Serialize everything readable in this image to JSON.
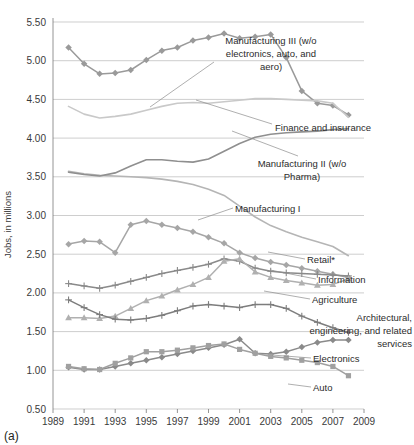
{
  "figure": {
    "caption": "(a)",
    "ylabel": "Jobs, in millions"
  },
  "chart_data": {
    "type": "line",
    "title": "",
    "xlabel": "",
    "ylabel": "Jobs, in millions",
    "xlim": [
      1989,
      2009
    ],
    "ylim": [
      0.5,
      5.5
    ],
    "yticks": [
      "0.50",
      "1.00",
      "1.50",
      "2.00",
      "2.50",
      "3.00",
      "3.50",
      "4.00",
      "4.50",
      "5.00",
      "5.50"
    ],
    "ytick_values": [
      0.5,
      1.0,
      1.5,
      2.0,
      2.5,
      3.0,
      3.5,
      4.0,
      4.5,
      5.0,
      5.5
    ],
    "xticks": [
      "1989",
      "1991",
      "1993",
      "1995",
      "1997",
      "1999",
      "2001",
      "2003",
      "2005",
      "2007",
      "2009"
    ],
    "xtick_values": [
      1989,
      1991,
      1993,
      1995,
      1997,
      1999,
      2001,
      2003,
      2005,
      2007,
      2009
    ],
    "grid": true,
    "legend": "inline-labels-right",
    "x": [
      1990,
      1991,
      1992,
      1993,
      1994,
      1995,
      1996,
      1997,
      1998,
      1999,
      2000,
      2001,
      2002,
      2003,
      2004,
      2005,
      2006,
      2007,
      2008
    ],
    "series": [
      {
        "name": "Manufacturing III (w/o electronics, auto, and aero)",
        "label": "Manufacturing III (w/o electronics, auto, and aero)",
        "color": "#9a9a9a",
        "marker": "diamond",
        "values": [
          5.17,
          4.96,
          4.83,
          4.84,
          4.88,
          5.01,
          5.13,
          5.17,
          5.26,
          5.3,
          5.35,
          5.29,
          5.31,
          5.34,
          5.04,
          4.61,
          4.45,
          4.42,
          4.3
        ]
      },
      {
        "name": "Finance and insurance",
        "label": "Finance and insurance",
        "color": "#c9c9c9",
        "marker": "none",
        "values": [
          4.41,
          4.31,
          4.26,
          4.28,
          4.31,
          4.36,
          4.41,
          4.45,
          4.46,
          4.45,
          4.47,
          4.49,
          4.51,
          4.51,
          4.5,
          4.49,
          4.48,
          4.45,
          4.27
        ]
      },
      {
        "name": "Manufacturing II (w/o Pharma)",
        "label": "Manufacturing II (w/o Pharma)",
        "color": "#b5b5b5",
        "marker": "none",
        "values": [
          3.57,
          3.54,
          3.52,
          3.51,
          3.5,
          3.49,
          3.47,
          3.44,
          3.4,
          3.34,
          3.26,
          3.12,
          2.98,
          2.87,
          2.79,
          2.72,
          2.66,
          2.6,
          2.48
        ]
      },
      {
        "name": "Manufacturing I",
        "label": "Manufacturing I",
        "color": "#8f8f8f",
        "marker": "none",
        "values": [
          3.56,
          3.53,
          3.51,
          3.55,
          3.64,
          3.72,
          3.72,
          3.7,
          3.69,
          3.73,
          3.83,
          3.93,
          4.01,
          4.05,
          4.07,
          4.08,
          4.09,
          4.11,
          4.12
        ]
      },
      {
        "name": "Retail*",
        "label": "Retail*",
        "color": "#a6a6a6",
        "marker": "diamond",
        "values": [
          2.63,
          2.67,
          2.66,
          2.52,
          2.88,
          2.93,
          2.88,
          2.84,
          2.79,
          2.72,
          2.64,
          2.52,
          2.45,
          2.4,
          2.36,
          2.32,
          2.28,
          2.24,
          2.2
        ]
      },
      {
        "name": "Information",
        "label": "Information",
        "color": "#8a8a8a",
        "marker": "plus",
        "values": [
          2.12,
          2.09,
          2.06,
          2.1,
          2.15,
          2.2,
          2.25,
          2.29,
          2.33,
          2.37,
          2.44,
          2.41,
          2.32,
          2.28,
          2.26,
          2.25,
          2.24,
          2.23,
          2.22
        ]
      },
      {
        "name": "Agriculture",
        "label": "Agriculture",
        "color": "#b0b0b0",
        "marker": "triangle",
        "values": [
          1.68,
          1.68,
          1.67,
          1.7,
          1.8,
          1.9,
          1.96,
          2.04,
          2.11,
          2.2,
          2.41,
          2.44,
          2.27,
          2.2,
          2.16,
          2.13,
          2.1,
          2.11,
          2.18
        ]
      },
      {
        "name": "Architectural, engineering, and related services",
        "label": "Architectural, engineering, and related services",
        "color": "#8a8a8a",
        "marker": "diamond",
        "values": [
          1.04,
          1.01,
          1.01,
          1.05,
          1.09,
          1.13,
          1.17,
          1.21,
          1.25,
          1.29,
          1.33,
          1.4,
          1.22,
          1.21,
          1.24,
          1.3,
          1.36,
          1.39,
          1.39
        ]
      },
      {
        "name": "Electronics",
        "label": "Electronics",
        "color": "#7d7d7d",
        "marker": "plus",
        "values": [
          1.91,
          1.81,
          1.72,
          1.66,
          1.65,
          1.67,
          1.71,
          1.77,
          1.83,
          1.85,
          1.83,
          1.81,
          1.85,
          1.85,
          1.8,
          1.7,
          1.62,
          1.55,
          1.49
        ]
      },
      {
        "name": "Auto",
        "label": "Auto",
        "color": "#a0a0a0",
        "marker": "square",
        "values": [
          1.05,
          1.02,
          1.01,
          1.09,
          1.16,
          1.24,
          1.24,
          1.26,
          1.29,
          1.32,
          1.34,
          1.27,
          1.22,
          1.18,
          1.16,
          1.13,
          1.1,
          1.05,
          0.93
        ]
      }
    ],
    "annotations": [
      {
        "text": "Manufacturing III (w/o electronics, auto, and aero)"
      },
      {
        "text": "Finance and insurance"
      },
      {
        "text": "Manufacturing II (w/o Pharma)"
      },
      {
        "text": "Manufacturing I"
      },
      {
        "text": "Retail*"
      },
      {
        "text": "Information"
      },
      {
        "text": "Agriculture"
      },
      {
        "text": "Architectural, engineering, and related services"
      },
      {
        "text": "Electronics"
      },
      {
        "text": "Auto"
      }
    ]
  },
  "labels": {
    "mfg3_line1": "Manufacturing III (w/o",
    "mfg3_line2": "electronics, auto, and",
    "mfg3_line3": "aero)",
    "finance": "Finance and insurance",
    "mfg2_line1": "Manufacturing II (w/o",
    "mfg2_line2": "Pharma)",
    "mfg1": "Manufacturing I",
    "retail": "Retail*",
    "information": "Information",
    "agriculture": "Agriculture",
    "aer_line1": "Architectural,",
    "aer_line2": "engineering, and related",
    "aer_line3": "services",
    "electronics": "Electronics",
    "auto": "Auto"
  }
}
